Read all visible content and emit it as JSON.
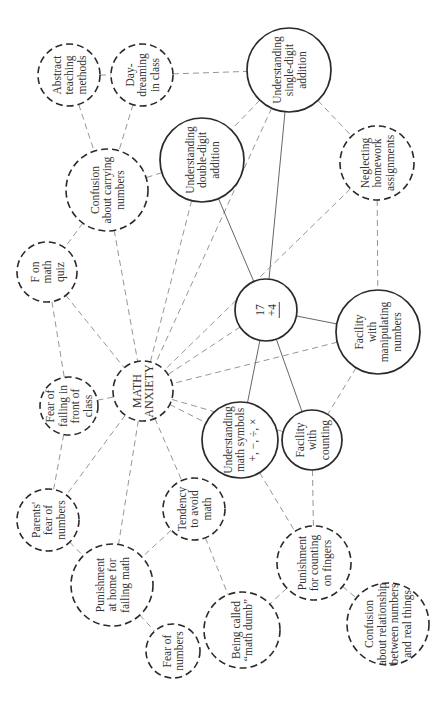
{
  "diagram": {
    "nodes": [
      {
        "id": "abstract",
        "lines": [
          "Abstract",
          "teaching",
          "methods"
        ],
        "style": "dashed"
      },
      {
        "id": "daydream",
        "lines": [
          "Day-",
          "dreaming",
          "in class"
        ],
        "style": "dashed"
      },
      {
        "id": "single",
        "lines": [
          "Understanding",
          "single-digit",
          "addition"
        ],
        "style": "solid"
      },
      {
        "id": "double",
        "lines": [
          "Understanding",
          "double-digit",
          "addition"
        ],
        "style": "solid"
      },
      {
        "id": "carrying",
        "lines": [
          "Confusion",
          "about carrying",
          "numbers"
        ],
        "style": "dashed"
      },
      {
        "id": "homework",
        "lines": [
          "Neglecting",
          "homework",
          "assignments"
        ],
        "style": "dashed"
      },
      {
        "id": "fquiz",
        "lines": [
          "F on",
          "math",
          "quiz"
        ],
        "style": "dashed"
      },
      {
        "id": "sum",
        "lines": [
          "17",
          "+4"
        ],
        "style": "solid",
        "underline_last": true
      },
      {
        "id": "manip",
        "lines": [
          "Facility",
          "with",
          "manipulating",
          "numbers"
        ],
        "style": "solid"
      },
      {
        "id": "failclass",
        "lines": [
          "Fear of",
          "failing in",
          "front of",
          "class"
        ],
        "style": "dashed"
      },
      {
        "id": "anxiety",
        "lines": [
          "MATH",
          "ANXIETY"
        ],
        "style": "dashed",
        "central": true
      },
      {
        "id": "symbols",
        "lines": [
          "Understanding",
          "math symbols",
          "+, −, ÷, ×"
        ],
        "style": "solid"
      },
      {
        "id": "counting",
        "lines": [
          "Facility",
          "with",
          "counting"
        ],
        "style": "solid"
      },
      {
        "id": "parents",
        "lines": [
          "Parents'",
          "fear of",
          "numbers"
        ],
        "style": "dashed"
      },
      {
        "id": "avoid",
        "lines": [
          "Tendency",
          "to avoid",
          "math"
        ],
        "style": "dashed"
      },
      {
        "id": "punishhome",
        "lines": [
          "Punishment",
          "at home for",
          "failing math"
        ],
        "style": "dashed"
      },
      {
        "id": "punishfingers",
        "lines": [
          "Punishment",
          "for counting",
          "on fingers"
        ],
        "style": "dashed"
      },
      {
        "id": "dumb",
        "lines": [
          "Being called",
          "“math dumb”"
        ],
        "style": "dashed"
      },
      {
        "id": "fearnum",
        "lines": [
          "Fear of",
          "numbers"
        ],
        "style": "dashed"
      },
      {
        "id": "realthings",
        "lines": [
          "Confusion",
          "about relationship",
          "between numbers",
          "and real things"
        ],
        "style": "dashed"
      }
    ],
    "edges": [
      {
        "from": "abstract",
        "to": "daydream",
        "style": "dashed"
      },
      {
        "from": "abstract",
        "to": "carrying",
        "style": "dashed"
      },
      {
        "from": "daydream",
        "to": "carrying",
        "style": "dashed"
      },
      {
        "from": "daydream",
        "to": "single",
        "style": "dashed"
      },
      {
        "from": "single",
        "to": "double",
        "style": "dashed"
      },
      {
        "from": "single",
        "to": "homework",
        "style": "dashed"
      },
      {
        "from": "single",
        "to": "sum",
        "style": "solid"
      },
      {
        "from": "single",
        "to": "anxiety",
        "style": "dashed"
      },
      {
        "from": "double",
        "to": "carrying",
        "style": "dashed"
      },
      {
        "from": "double",
        "to": "sum",
        "style": "solid"
      },
      {
        "from": "double",
        "to": "anxiety",
        "style": "dashed"
      },
      {
        "from": "carrying",
        "to": "fquiz",
        "style": "dashed"
      },
      {
        "from": "carrying",
        "to": "anxiety",
        "style": "dashed"
      },
      {
        "from": "homework",
        "to": "manip",
        "style": "dashed"
      },
      {
        "from": "homework",
        "to": "anxiety",
        "style": "dashed"
      },
      {
        "from": "fquiz",
        "to": "failclass",
        "style": "dashed"
      },
      {
        "from": "fquiz",
        "to": "anxiety",
        "style": "dashed"
      },
      {
        "from": "sum",
        "to": "manip",
        "style": "solid"
      },
      {
        "from": "sum",
        "to": "symbols",
        "style": "solid"
      },
      {
        "from": "sum",
        "to": "counting",
        "style": "solid"
      },
      {
        "from": "sum",
        "to": "anxiety",
        "style": "dashed"
      },
      {
        "from": "manip",
        "to": "counting",
        "style": "dashed"
      },
      {
        "from": "manip",
        "to": "anxiety",
        "style": "dashed"
      },
      {
        "from": "failclass",
        "to": "anxiety",
        "style": "dashed"
      },
      {
        "from": "failclass",
        "to": "parents",
        "style": "dashed"
      },
      {
        "from": "anxiety",
        "to": "counting",
        "style": "dashed"
      },
      {
        "from": "anxiety",
        "to": "symbols",
        "style": "dashed"
      },
      {
        "from": "anxiety",
        "to": "parents",
        "style": "dashed"
      },
      {
        "from": "anxiety",
        "to": "punishhome",
        "style": "dashed"
      },
      {
        "from": "anxiety",
        "to": "avoid",
        "style": "dashed"
      },
      {
        "from": "parents",
        "to": "punishhome",
        "style": "dashed"
      },
      {
        "from": "avoid",
        "to": "punishhome",
        "style": "dashed"
      },
      {
        "from": "avoid",
        "to": "dumb",
        "style": "dashed"
      },
      {
        "from": "symbols",
        "to": "punishfingers",
        "style": "dashed"
      },
      {
        "from": "counting",
        "to": "punishfingers",
        "style": "dashed"
      },
      {
        "from": "punishfingers",
        "to": "dumb",
        "style": "dashed"
      },
      {
        "from": "punishfingers",
        "to": "realthings",
        "style": "dashed"
      },
      {
        "from": "punishhome",
        "to": "fearnum",
        "style": "dashed"
      }
    ]
  }
}
